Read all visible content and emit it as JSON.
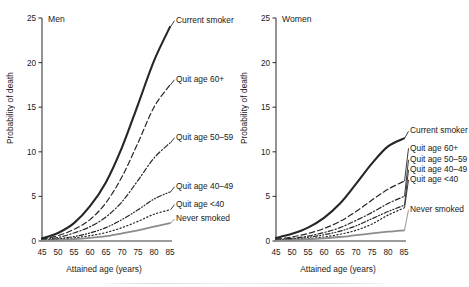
{
  "figure": {
    "width": 469,
    "height": 287,
    "background": "#ffffff"
  },
  "axis": {
    "xlabel": "Attained age (years)",
    "ylabel": "Probability of death",
    "xticks": [
      "45",
      "50",
      "55",
      "60",
      "65",
      "70",
      "75",
      "80",
      "85"
    ],
    "yticks": [
      "0",
      "5",
      "10",
      "15",
      "20",
      "25"
    ],
    "xlim": [
      45,
      85
    ],
    "ylim": [
      0,
      25
    ]
  },
  "panels": [
    {
      "title": "Men"
    },
    {
      "title": "Women"
    }
  ],
  "series_labels": {
    "current_smoker": "Current smoker",
    "quit_60": "Quit age 60+",
    "quit_50_59": "Quit age 50–59",
    "quit_40_49": "Quit age 40–49",
    "quit_under_40": "Quit age <40",
    "never_smoked": "Never smoked"
  },
  "colors": {
    "line_black": "#262626",
    "line_grey": "#8c8c8c",
    "axis": "#3b3b3b",
    "text": "#1a1a1a"
  },
  "chart_data": {
    "type": "line",
    "xlabel": "Attained age (years)",
    "ylabel": "Probability of death",
    "xlim": [
      45,
      85
    ],
    "ylim": [
      0,
      25
    ],
    "grid": false,
    "legend": "inline-right-of-curve",
    "x": [
      45,
      50,
      55,
      60,
      65,
      70,
      75,
      80,
      85
    ],
    "panels": [
      {
        "name": "Men",
        "series": [
          {
            "name": "Current smoker",
            "style": "solid",
            "width": 2.1,
            "color": "#262626",
            "values": [
              0.3,
              0.9,
              2.0,
              3.9,
              6.6,
              10.5,
              15.3,
              20.2,
              24.0
            ]
          },
          {
            "name": "Quit age 60+",
            "style": "dashed",
            "width": 1.2,
            "color": "#262626",
            "values": [
              0.2,
              0.6,
              1.3,
              2.4,
              4.3,
              7.2,
              11.0,
              15.0,
              17.5
            ]
          },
          {
            "name": "Quit age 50–59",
            "style": "dashdot",
            "width": 1.2,
            "color": "#262626",
            "values": [
              0.15,
              0.4,
              0.9,
              1.6,
              2.7,
              4.4,
              6.8,
              9.3,
              11.0
            ]
          },
          {
            "name": "Quit age 40–49",
            "style": "dashdotdot",
            "width": 1.2,
            "color": "#262626",
            "values": [
              0.1,
              0.25,
              0.5,
              0.9,
              1.5,
              2.4,
              3.5,
              4.7,
              5.5
            ]
          },
          {
            "name": "Quit age <40",
            "style": "dotted",
            "width": 1.2,
            "color": "#262626",
            "values": [
              0.08,
              0.18,
              0.35,
              0.6,
              0.95,
              1.5,
              2.2,
              3.0,
              3.5
            ]
          },
          {
            "name": "Never smoked",
            "style": "solid",
            "width": 1.8,
            "color": "#8c8c8c",
            "values": [
              0.05,
              0.1,
              0.2,
              0.35,
              0.55,
              0.85,
              1.2,
              1.6,
              2.0
            ]
          }
        ]
      },
      {
        "name": "Women",
        "series": [
          {
            "name": "Current smoker",
            "style": "solid",
            "width": 2.1,
            "color": "#262626",
            "values": [
              0.35,
              0.8,
              1.5,
              2.6,
              4.2,
              6.4,
              8.7,
              10.6,
              11.5
            ]
          },
          {
            "name": "Quit age 60+",
            "style": "dashed",
            "width": 1.2,
            "color": "#262626",
            "values": [
              0.2,
              0.45,
              0.85,
              1.4,
              2.2,
              3.3,
              4.6,
              5.8,
              6.7
            ]
          },
          {
            "name": "Quit age 50–59",
            "style": "dashdot",
            "width": 1.2,
            "color": "#262626",
            "values": [
              0.15,
              0.3,
              0.55,
              0.95,
              1.5,
              2.3,
              3.2,
              4.2,
              5.0
            ]
          },
          {
            "name": "Quit age 40–49",
            "style": "dashdotdot",
            "width": 1.2,
            "color": "#262626",
            "values": [
              0.1,
              0.22,
              0.4,
              0.7,
              1.1,
              1.7,
              2.5,
              3.3,
              4.0
            ]
          },
          {
            "name": "Quit age <40",
            "style": "dotted",
            "width": 1.2,
            "color": "#262626",
            "values": [
              0.06,
              0.12,
              0.25,
              0.45,
              0.75,
              1.2,
              1.9,
              2.9,
              3.7
            ]
          },
          {
            "name": "Never smoked",
            "style": "solid",
            "width": 1.8,
            "color": "#8c8c8c",
            "values": [
              0.05,
              0.1,
              0.18,
              0.3,
              0.45,
              0.65,
              0.85,
              1.05,
              1.2
            ]
          }
        ]
      }
    ]
  }
}
